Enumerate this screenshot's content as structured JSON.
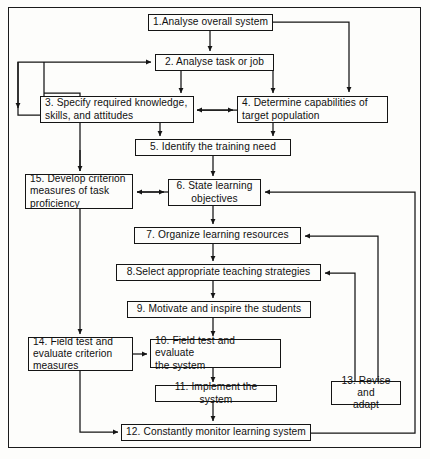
{
  "diagram": {
    "type": "flowchart",
    "border_color": "#141414",
    "background_color": "#fdfdfb",
    "nodes": [
      {
        "id": "n1",
        "number": "1.",
        "label": "1.Analyse overall system"
      },
      {
        "id": "n2",
        "number": "2.",
        "label": "2. Analyse  task or job"
      },
      {
        "id": "n3",
        "number": "3.",
        "label": "3. Specify required knowledge,\n    skills, and attitudes"
      },
      {
        "id": "n4",
        "number": "4.",
        "label": "4. Determine capabilities of\n     target population"
      },
      {
        "id": "n5",
        "number": "5.",
        "label": "5. Identify  the  training  need"
      },
      {
        "id": "n6",
        "number": "6.",
        "label": "6. State  learning\nobjectives"
      },
      {
        "id": "n7",
        "number": "7.",
        "label": "7. Organize learning resources"
      },
      {
        "id": "n8",
        "number": "8.",
        "label": "8.Select appropriate teaching strategies"
      },
      {
        "id": "n9",
        "number": "9.",
        "label": "9. Motivate and inspire the students"
      },
      {
        "id": "n10",
        "number": "10.",
        "label": "10. Field test and evaluate\n      the system"
      },
      {
        "id": "n11",
        "number": "11.",
        "label": "11. Implement  the  system"
      },
      {
        "id": "n12",
        "number": "12.",
        "label": "12. Constantly  monitor  learning  system"
      },
      {
        "id": "n13",
        "number": "13.",
        "label": "13. Revise and\nadapt"
      },
      {
        "id": "n14",
        "number": "14.",
        "label": "14. Field test and\n       evaluate criterion\n       measures"
      },
      {
        "id": "n15",
        "number": "15.",
        "label": "15. Develop criterion\n      measures of task\n      proficiency"
      }
    ],
    "edges": [
      {
        "from": "n1",
        "to": "n2",
        "kind": "down"
      },
      {
        "from": "n1",
        "to": "n4",
        "kind": "right-down"
      },
      {
        "from": "n2",
        "to": "n3",
        "kind": "down"
      },
      {
        "from": "n2",
        "to": "n4",
        "kind": "right-down"
      },
      {
        "from": "n3",
        "to": "n5",
        "kind": "down"
      },
      {
        "from": "n4",
        "to": "n3",
        "kind": "left"
      },
      {
        "from": "n4",
        "to": "n5",
        "kind": "down"
      },
      {
        "from": "n5",
        "to": "n6",
        "kind": "down"
      },
      {
        "from": "n6",
        "to": "n15",
        "kind": "left"
      },
      {
        "from": "n6",
        "to": "n7",
        "kind": "down"
      },
      {
        "from": "n7",
        "to": "n8",
        "kind": "down"
      },
      {
        "from": "n8",
        "to": "n9",
        "kind": "down"
      },
      {
        "from": "n9",
        "to": "n10",
        "kind": "down"
      },
      {
        "from": "n15",
        "to": "n14",
        "kind": "down"
      },
      {
        "from": "n14",
        "to": "n10",
        "kind": "right"
      },
      {
        "from": "n14",
        "to": "n12",
        "kind": "down-right"
      },
      {
        "from": "n10",
        "to": "n11",
        "kind": "down"
      },
      {
        "from": "n11",
        "to": "n12",
        "kind": "down"
      },
      {
        "from": "n12",
        "to": "n13",
        "kind": "right-up"
      },
      {
        "from": "n13",
        "to": "n8",
        "kind": "up-left"
      },
      {
        "from": "n13",
        "to": "n7",
        "kind": "up-left"
      },
      {
        "from": "n12",
        "to": "n6",
        "kind": "far-right-up"
      },
      {
        "from": "n3",
        "to": "n2",
        "kind": "far-left-up"
      }
    ]
  }
}
